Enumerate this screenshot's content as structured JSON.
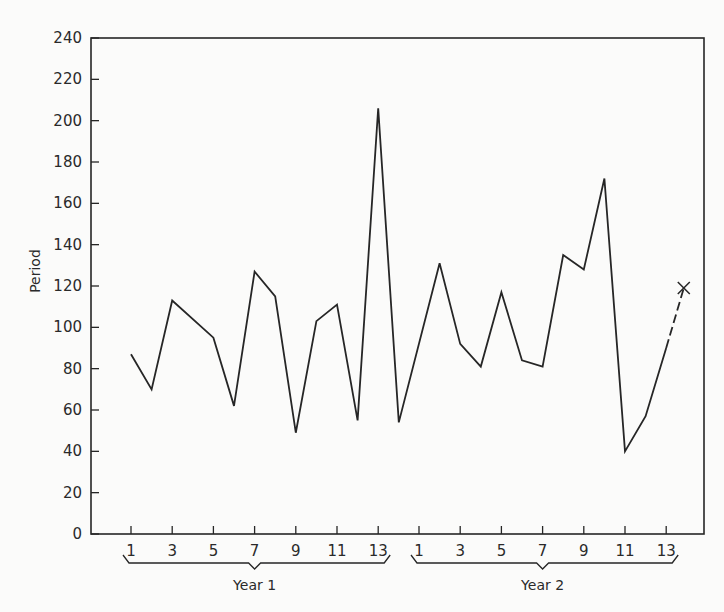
{
  "chart_data": {
    "type": "line",
    "title": "",
    "xlabel": "",
    "ylabel": "Period",
    "ylim": [
      0,
      240
    ],
    "yticks": [
      0,
      20,
      40,
      60,
      80,
      100,
      120,
      140,
      160,
      180,
      200,
      220,
      240
    ],
    "grid": false,
    "groups": [
      {
        "name": "Year 1",
        "tick_labels": [
          "1",
          "3",
          "5",
          "7",
          "9",
          "11",
          "13"
        ]
      },
      {
        "name": "Year 2",
        "tick_labels": [
          "1",
          "3",
          "5",
          "7",
          "9",
          "11",
          "13"
        ]
      }
    ],
    "series": [
      {
        "name": "Year 1",
        "style": "solid",
        "x": [
          1,
          2,
          3,
          5,
          6,
          7,
          8,
          9,
          10,
          11,
          12,
          13,
          14
        ],
        "values": [
          87,
          70,
          113,
          95,
          62,
          127,
          115,
          49,
          103,
          111,
          55,
          206,
          54
        ]
      },
      {
        "name": "Year 2",
        "style": "solid",
        "x": [
          2,
          3,
          4,
          5,
          6,
          7,
          8,
          9,
          10,
          11,
          12,
          13
        ],
        "values": [
          131,
          92,
          81,
          117,
          84,
          81,
          135,
          128,
          172,
          40,
          57,
          90
        ]
      },
      {
        "name": "Forecast",
        "style": "dashed",
        "marker": "x",
        "x": [
          13,
          14
        ],
        "values": [
          90,
          119
        ]
      }
    ]
  }
}
